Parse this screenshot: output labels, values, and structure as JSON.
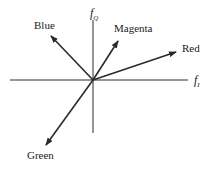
{
  "diagram": {
    "axes": {
      "horizontal_label": "f",
      "horizontal_sub": "I",
      "vertical_label": "f",
      "vertical_sub": "Q"
    },
    "vectors": [
      {
        "label": "Blue"
      },
      {
        "label": "Magenta"
      },
      {
        "label": "Red"
      },
      {
        "label": "Green"
      }
    ],
    "colors": {
      "line": "#2a2a2a",
      "background": "#ffffff"
    }
  }
}
